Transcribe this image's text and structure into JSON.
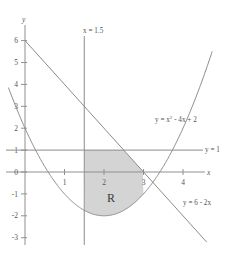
{
  "chart_data": {
    "type": "line",
    "title": "",
    "xlabel": "x",
    "ylabel": "y",
    "xlim": [
      -0.45,
      5.05
    ],
    "ylim": [
      -3.45,
      6.6
    ],
    "grid": false,
    "legend_position": "inline-annotations",
    "x_ticks": [
      "1",
      "2",
      "3",
      "4"
    ],
    "x_tick_values": [
      1,
      2,
      3,
      4
    ],
    "y_ticks": [
      "6",
      "5",
      "4",
      "3",
      "2",
      "1",
      "0",
      "-1",
      "-2",
      "-3"
    ],
    "y_tick_values": [
      6,
      5,
      4,
      3,
      2,
      1,
      0,
      -1,
      -2,
      -3
    ],
    "series": [
      {
        "name": "y = x² - 4x + 2",
        "label_text_main": "y = x",
        "label_text_sup": "2",
        "label_text_rest": " - 4x + 2",
        "type": "parabola",
        "equation": "y = x^2 - 4x + 2",
        "coefficients": {
          "a": 1,
          "b": -4,
          "c": 2
        },
        "vertex": [
          2,
          -2
        ],
        "roots": [
          0.5858,
          3.4142
        ],
        "y_intercept": 2,
        "color": "#8c8c8c"
      },
      {
        "name": "y = 6 - 2x",
        "label_text": "y = 6 - 2x",
        "type": "line",
        "equation": "y = 6 - 2x",
        "slope": -2,
        "intercept": 6,
        "points": [
          [
            0,
            6
          ],
          [
            4.6,
            -3.2
          ]
        ],
        "color": "#8c8c8c"
      },
      {
        "name": "y = 1",
        "label_text": "y = 1",
        "type": "horizontal-line",
        "equation": "y = 1",
        "value": 1,
        "color": "#8c8c8c"
      },
      {
        "name": "x = 1.5",
        "label_text": "x = 1.5",
        "type": "vertical-line",
        "equation": "x = 1.5",
        "value": 1.5,
        "color": "#8c8c8c"
      }
    ],
    "shaded_region": {
      "label": "R",
      "fill_color": "#d4d4d4",
      "x_start": 1.5,
      "x_end": 3.0,
      "upper_bounds": [
        "y = 1 (from x=1.5 to x=2.5)",
        "y = 6 - 2x (from x=2.5 to x=3)"
      ],
      "lower_bound": "y = x² - 4x + 2"
    },
    "annotations": [
      {
        "text": "R",
        "x": 2.35,
        "y": -1.1
      },
      {
        "text": "x = 1.5",
        "x": 1.62,
        "y": 5.85
      },
      {
        "text": "y = 1",
        "x": 4.75,
        "y": 1.0
      },
      {
        "text": "y = 6 - 2x",
        "x": 4.05,
        "y": -2.0
      },
      {
        "text": "y = x² - 4x + 2",
        "x": 3.55,
        "y": 2.35
      }
    ]
  },
  "colors": {
    "axis": "#909090",
    "curve": "#8c8c8c",
    "shade": "#d4d4d4",
    "text": "#555555",
    "background": "#ffffff"
  }
}
